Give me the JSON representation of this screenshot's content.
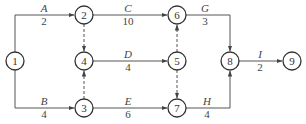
{
  "diagram": {
    "type": "activity-on-arrow network",
    "nodes": [
      {
        "id": "1",
        "label": "1",
        "x": 15,
        "y": 61
      },
      {
        "id": "2",
        "label": "2",
        "x": 84,
        "y": 15
      },
      {
        "id": "3",
        "label": "3",
        "x": 84,
        "y": 108
      },
      {
        "id": "4",
        "label": "4",
        "x": 84,
        "y": 61
      },
      {
        "id": "5",
        "label": "5",
        "x": 177,
        "y": 61
      },
      {
        "id": "6",
        "label": "6",
        "x": 177,
        "y": 15
      },
      {
        "id": "7",
        "label": "7",
        "x": 177,
        "y": 108
      },
      {
        "id": "8",
        "label": "8",
        "x": 230,
        "y": 61
      },
      {
        "id": "9",
        "label": "9",
        "x": 292,
        "y": 61
      }
    ],
    "activities": [
      {
        "name": "A",
        "duration": "2",
        "from": "1",
        "to": "2"
      },
      {
        "name": "B",
        "duration": "4",
        "from": "1",
        "to": "3"
      },
      {
        "name": "C",
        "duration": "10",
        "from": "2",
        "to": "6"
      },
      {
        "name": "D",
        "duration": "4",
        "from": "4",
        "to": "5"
      },
      {
        "name": "E",
        "duration": "6",
        "from": "3",
        "to": "7"
      },
      {
        "name": "G",
        "duration": "3",
        "from": "6",
        "to": "8"
      },
      {
        "name": "H",
        "duration": "4",
        "from": "7",
        "to": "8"
      },
      {
        "name": "I",
        "duration": "2",
        "from": "8",
        "to": "9"
      }
    ],
    "dummies": [
      {
        "from": "2",
        "to": "4"
      },
      {
        "from": "3",
        "to": "4"
      },
      {
        "from": "5",
        "to": "6"
      },
      {
        "from": "5",
        "to": "7"
      }
    ]
  }
}
